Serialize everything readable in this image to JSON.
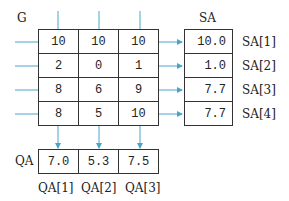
{
  "title_G": "G",
  "title_SA": "SA",
  "title_QA": "QA",
  "grid": [
    [
      "10",
      "10",
      "10"
    ],
    [
      "2",
      "0",
      "1"
    ],
    [
      "8",
      "6",
      "9"
    ],
    [
      "8",
      "5",
      "10"
    ]
  ],
  "sa": {
    "values": [
      "10.0",
      "1.0",
      "7.7",
      "7.7"
    ],
    "labels": [
      "SA[1]",
      "SA[2]",
      "SA[3]",
      "SA[4]"
    ]
  },
  "qa": {
    "values": [
      "7.0",
      "5.3",
      "7.5"
    ],
    "labels": [
      "QA[1]",
      "QA[2]",
      "QA[3]"
    ]
  },
  "colors": {
    "arrow": "#4aa6c8",
    "border": "#333333"
  }
}
